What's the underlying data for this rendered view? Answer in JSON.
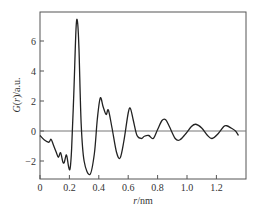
{
  "chart_data": {
    "type": "line",
    "title": "",
    "xlabel": "r/nm",
    "ylabel": "G(r)/a.u.",
    "xlim": [
      0,
      1.4
    ],
    "ylim": [
      -3.2,
      7.9
    ],
    "xticks": [
      0,
      0.2,
      0.4,
      0.6,
      0.8,
      1.0,
      1.2
    ],
    "xtick_labels": [
      "0",
      "0.2",
      "0.4",
      "0.6",
      "0.8",
      "1.0",
      "1.2"
    ],
    "yticks": [
      -2,
      0,
      2,
      4,
      6
    ],
    "ytick_labels": [
      "−2",
      "0",
      "2",
      "4",
      "6"
    ],
    "grid": false,
    "legend": null,
    "reference_line": {
      "y": 0
    },
    "series": [
      {
        "name": "G(r)",
        "color": "#222222",
        "x": [
          0.0,
          0.03,
          0.06,
          0.075,
          0.09,
          0.11,
          0.125,
          0.14,
          0.155,
          0.165,
          0.18,
          0.195,
          0.205,
          0.215,
          0.23,
          0.245,
          0.255,
          0.265,
          0.28,
          0.3,
          0.34,
          0.37,
          0.39,
          0.41,
          0.43,
          0.45,
          0.465,
          0.49,
          0.52,
          0.545,
          0.57,
          0.6,
          0.615,
          0.635,
          0.66,
          0.69,
          0.71,
          0.74,
          0.77,
          0.8,
          0.83,
          0.855,
          0.88,
          0.92,
          0.95,
          0.99,
          1.03,
          1.06,
          1.1,
          1.14,
          1.17,
          1.21,
          1.25,
          1.27,
          1.3,
          1.33,
          1.35
        ],
        "y": [
          -0.3,
          -0.6,
          -0.75,
          -0.55,
          -0.9,
          -1.4,
          -1.75,
          -1.45,
          -2.05,
          -2.1,
          -1.6,
          -2.4,
          -2.5,
          -1.2,
          2.5,
          6.8,
          7.3,
          5.5,
          0.5,
          -2.0,
          -2.9,
          -1.5,
          0.8,
          2.2,
          1.6,
          1.1,
          1.4,
          0.2,
          -1.4,
          -1.8,
          -0.7,
          1.2,
          1.5,
          0.7,
          -0.3,
          -0.5,
          -0.35,
          -0.3,
          -0.5,
          0.1,
          0.7,
          0.75,
          0.3,
          -0.5,
          -0.6,
          -0.2,
          0.3,
          0.45,
          0.2,
          -0.3,
          -0.5,
          -0.2,
          0.3,
          0.35,
          0.2,
          0.0,
          -0.3
        ]
      }
    ]
  }
}
